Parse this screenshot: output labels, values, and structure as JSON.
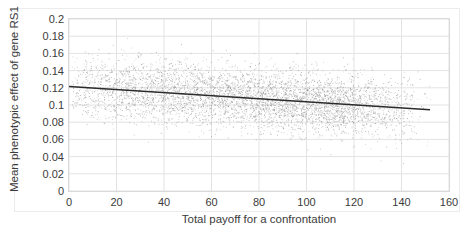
{
  "chart_data": {
    "type": "scatter",
    "title": "",
    "xlabel": "Total payoff for a confrontation",
    "ylabel": "Mean phenotypic effect of gene RS1",
    "xlim": [
      0,
      160
    ],
    "ylim": [
      0,
      0.2
    ],
    "xticks": [
      0,
      20,
      40,
      60,
      80,
      100,
      120,
      140,
      160
    ],
    "yticks": [
      0,
      0.02,
      0.04,
      0.06,
      0.08,
      0.1,
      0.12,
      0.14,
      0.16,
      0.18,
      0.2
    ],
    "xtick_labels": [
      "0",
      "20",
      "40",
      "60",
      "80",
      "100",
      "120",
      "140",
      "160"
    ],
    "ytick_labels": [
      "0",
      "0.02",
      "0.04",
      "0.06",
      "0.08",
      "0.1",
      "0.12",
      "0.14",
      "0.16",
      "0.18",
      "0.2"
    ],
    "grid": true,
    "grid_color": "#e3e3e3",
    "legend": false,
    "series": [
      {
        "name": "Mean phenotypic effect of gene RS1",
        "marker": "dot",
        "marker_color": "#8a8a8a",
        "marker_size": 1,
        "point_count": 6000,
        "x_range": [
          1,
          152
        ],
        "x_density_note": "dense from 0 to about 120, thinning tail to 152",
        "scatter_spread": 0.018,
        "description": "dense gray point cloud centred on the downward trend, spanning roughly 0.08 to 0.15"
      }
    ],
    "trendline": {
      "name": "linear trend",
      "color": "#2b2b2b",
      "width": 1.4,
      "x_start": 0,
      "x_end": 152,
      "y_start": 0.1215,
      "y_end": 0.0945,
      "slope": -0.0001776,
      "intercept": 0.1215
    }
  },
  "axes": {
    "y_title": "Mean phenotypic effect of gene RS1",
    "x_title": "Total payoff for a confrontation"
  }
}
